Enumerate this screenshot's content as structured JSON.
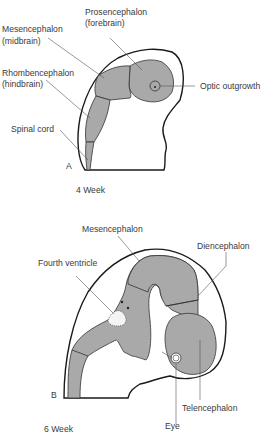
{
  "figure": {
    "panel_a": {
      "letter": "A",
      "caption": "4 Week",
      "labels": {
        "prosencephalon": "Prosencephalon",
        "prosencephalon_sub": "(forebrain)",
        "mesencephalon": "Mesencephalon",
        "mesencephalon_sub": "(midbrain)",
        "rhombencephalon": "Rhombencephalon",
        "rhombencephalon_sub": "(hindbrain)",
        "optic_outgrowth": "Optic outgrowth",
        "spinal_cord": "Spinal cord"
      }
    },
    "panel_b": {
      "letter": "B",
      "caption": "6 Week",
      "labels": {
        "mesencephalon": "Mesencephalon",
        "diencephalon": "Diencephalon",
        "fourth_ventricle": "Fourth ventricle",
        "telencephalon": "Telencephalon",
        "eye": "Eye"
      }
    },
    "colors": {
      "brain_fill": "#a9a9a9",
      "outline": "#1a1a1a",
      "leader_line": "#555555"
    }
  }
}
